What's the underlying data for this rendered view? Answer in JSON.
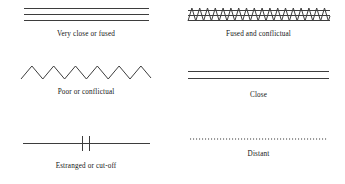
{
  "figure": {
    "kind": "relationship-line-legend",
    "columns": 2,
    "rows": 3,
    "line_color": "#3d3d3d",
    "dotted_color": "#7a7a7a",
    "background_color": "#ffffff"
  },
  "items": [
    {
      "id": "very-close-or-fused",
      "label": "Very close or fused",
      "symbol": "three-parallel-lines",
      "line_count": 3,
      "line_spacing_px": 6,
      "line_width_px": 125,
      "stroke_px": 1
    },
    {
      "id": "fused-and-conflictual",
      "label": "Fused and conflictual",
      "symbol": "three-parallel-lines-with-zigzag-overlay",
      "line_count": 3,
      "line_spacing_px": 5,
      "line_width_px": 142,
      "zigzag_peaks": 12,
      "zigzag_amplitude_px": 7,
      "stroke_px": 1
    },
    {
      "id": "poor-or-conflictual",
      "label": "Poor or conflictual",
      "symbol": "zigzag-line",
      "line_width_px": 130,
      "zigzag_peaks": 6,
      "zigzag_amplitude_px": 13,
      "stroke_px": 1
    },
    {
      "id": "close",
      "label": "Close",
      "symbol": "two-parallel-lines",
      "line_count": 2,
      "line_spacing_px": 7,
      "line_width_px": 141,
      "stroke_px": 1
    },
    {
      "id": "estranged-or-cut-off",
      "label": "Estranged or cut-off",
      "symbol": "line-with-two-cross-hatches",
      "line_width_px": 127,
      "hatch_count": 2,
      "hatch_height_px": 16,
      "hatch_gap_px": 7,
      "stroke_px": 1
    },
    {
      "id": "distant",
      "label": "Distant",
      "symbol": "dotted-line",
      "line_width_px": 138,
      "dot_count": 46,
      "stroke_px": 1
    }
  ]
}
